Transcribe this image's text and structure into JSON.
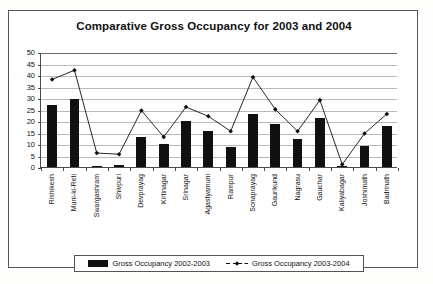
{
  "chart_data": {
    "type": "bar",
    "title": "Comparative Gross Occupancy for 2003 and 2004",
    "xlabel": "",
    "ylabel": "",
    "ylim": [
      0,
      50
    ],
    "yticks": [
      0,
      5,
      10,
      15,
      20,
      25,
      30,
      35,
      40,
      45,
      50
    ],
    "grid": true,
    "legend_position": "bottom",
    "categories": [
      "Rishikesh",
      "Muni-ki-Reti",
      "Swargashram",
      "Shivpuri",
      "Devprayag",
      "Kirtinagar",
      "Srinagar",
      "Agastyamuni",
      "Rampur",
      "Sonaprayag",
      "Gaurikund",
      "Nagrasu",
      "Gauchar",
      "Kaliyabagar",
      "Joshimath",
      "Badrinath"
    ],
    "series": [
      {
        "name": "Gross Occupancy 2002-2003",
        "kind": "bar",
        "color": "#101010",
        "values": [
          27,
          29.5,
          0.5,
          1,
          13,
          10,
          20,
          15.5,
          8.5,
          23,
          18.5,
          12,
          21.5,
          0.3,
          9,
          18
        ]
      },
      {
        "name": "Gross Occupancy 2003-2004",
        "kind": "line",
        "color": "#101010",
        "marker": "diamond",
        "values": [
          38.5,
          42.5,
          6.5,
          6,
          25,
          13.5,
          26.5,
          22.5,
          16,
          39.5,
          25.5,
          16,
          29.5,
          1.5,
          15,
          23.5
        ]
      }
    ]
  }
}
